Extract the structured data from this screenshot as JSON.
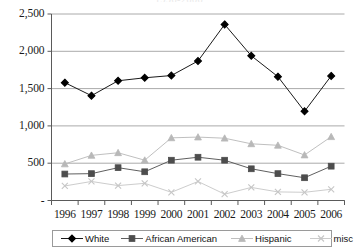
{
  "chart_data": {
    "type": "line",
    "title": "1996-2006",
    "xlabel": "",
    "ylabel": "",
    "categories": [
      "1996",
      "1997",
      "1998",
      "1999",
      "2000",
      "2001",
      "2002",
      "2003",
      "2004",
      "2005",
      "2006"
    ],
    "ylim": [
      0,
      2500
    ],
    "yticks": [
      0,
      500,
      1000,
      1500,
      2000,
      2500
    ],
    "ytick_labels": [
      "-",
      "500",
      "1,000",
      "1,500",
      "2,000",
      "2,500"
    ],
    "grid": true,
    "legend_position": "bottom",
    "series": [
      {
        "name": "White",
        "marker": "diamond",
        "color": "#000000",
        "values": [
          1580,
          1405,
          1605,
          1645,
          1675,
          1870,
          2360,
          1940,
          1660,
          1195,
          1670
        ]
      },
      {
        "name": "African American",
        "marker": "square",
        "color": "#4d4d4d",
        "values": [
          355,
          360,
          440,
          385,
          540,
          580,
          540,
          425,
          360,
          305,
          460
        ]
      },
      {
        "name": "Hispanic",
        "marker": "triangle",
        "color": "#b8b8b8",
        "values": [
          490,
          605,
          640,
          540,
          840,
          850,
          835,
          760,
          740,
          610,
          855
        ]
      },
      {
        "name": "misc",
        "marker": "x",
        "color": "#c6c6c6",
        "values": [
          195,
          255,
          200,
          230,
          110,
          255,
          85,
          175,
          115,
          110,
          150
        ]
      }
    ]
  },
  "axis": {
    "y_labels": [
      "2,500",
      "2,000",
      "1,500",
      "1,000",
      "500",
      "-"
    ],
    "x_labels": [
      "1996",
      "1997",
      "1998",
      "1999",
      "2000",
      "2001",
      "2002",
      "2003",
      "2004",
      "2005",
      "2006"
    ]
  },
  "legend": {
    "items": [
      {
        "label": "White",
        "marker": "diamond-marker-icon"
      },
      {
        "label": "African American",
        "marker": "square-marker-icon"
      },
      {
        "label": "Hispanic",
        "marker": "triangle-marker-icon"
      },
      {
        "label": "misc",
        "marker": "x-marker-icon"
      }
    ]
  }
}
